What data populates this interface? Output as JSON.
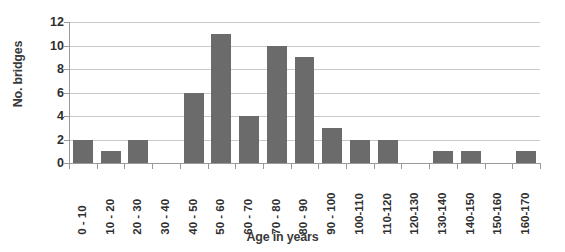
{
  "chart_data": {
    "type": "bar",
    "title": "",
    "subtitle": "",
    "xlabel": "Age in years",
    "ylabel": "No. bridges",
    "categories": [
      "0 - 10",
      "10 - 20",
      "20 - 30",
      "30 - 40",
      "40 - 50",
      "50 - 60",
      "60 - 70",
      "70 - 80",
      "80 - 90",
      "90 - 100",
      "100-110",
      "110-120",
      "120-130",
      "130-140",
      "140-150",
      "150-160",
      "160-170"
    ],
    "values": [
      2,
      1,
      2,
      0,
      6,
      11,
      4,
      10,
      9,
      3,
      2,
      2,
      0,
      1,
      1,
      0,
      1
    ],
    "ylim": [
      0,
      12
    ],
    "ytick_values": [
      0,
      2,
      4,
      6,
      8,
      10,
      12
    ],
    "ytick_labels": [
      "0",
      "2",
      "4",
      "6",
      "8",
      "10",
      "12"
    ],
    "grid": true,
    "grid_axis": "y",
    "legend": false,
    "legend_position": "none",
    "bar_color": "#6b6b6b",
    "gridline_color": "#c9c9c9",
    "axis_color": "#9a9a9a",
    "background_color": "#ffffff",
    "text_color": "#2e2e2e",
    "xtick_label_rotation": 90
  }
}
